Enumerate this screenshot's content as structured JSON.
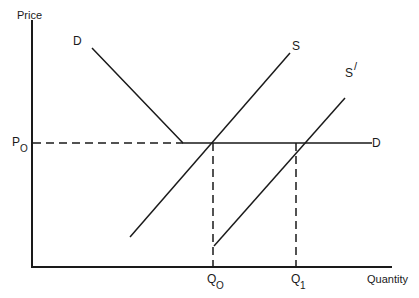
{
  "diagram": {
    "type": "supply-demand",
    "axes": {
      "y_label": "Price",
      "x_label": "Quantity"
    },
    "price_level": {
      "label": "P",
      "subscript": "O"
    },
    "quantity_levels": [
      {
        "label": "Q",
        "subscript": "O"
      },
      {
        "label": "Q",
        "subscript": "1"
      }
    ],
    "curves": {
      "demand_top_label": "D",
      "demand_right_label": "D",
      "supply_label": "S",
      "supply_shifted_label": "S",
      "supply_shifted_prime": "/"
    },
    "colors": {
      "line": "#1a1a1a",
      "background": "#ffffff"
    }
  }
}
